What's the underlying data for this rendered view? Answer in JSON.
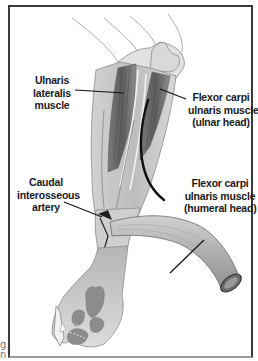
{
  "figure": {
    "type": "anatomical-illustration",
    "frame_color": "#3a3a3a",
    "colors": {
      "skin_light": "#e6e6e6",
      "skin_mid": "#c8c8c8",
      "skin_dark": "#a9a9a9",
      "muscle": "#8a8a8a",
      "muscle_dark": "#5e5e5e",
      "leader_line": "#111111",
      "pad": "#8c8c8c"
    }
  },
  "labels": {
    "ulnaris_lateralis": {
      "lines": [
        "Ulnaris",
        "lateralis",
        "muscle"
      ]
    },
    "fcu_ulnar_head": {
      "lines": [
        "Flexor carpi",
        "ulnaris muscle",
        "(ulnar head)"
      ]
    },
    "caudal_interosseous": {
      "lines": [
        "Caudal",
        "interosseous",
        "artery"
      ]
    },
    "fcu_humeral_head": {
      "lines": [
        "Flexor carpi",
        "ulnaris muscle",
        "(humeral head)"
      ]
    }
  },
  "margin_text": {
    "line1": "g",
    "line2": "n"
  }
}
